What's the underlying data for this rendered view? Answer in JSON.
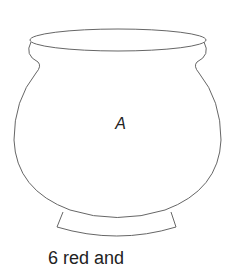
{
  "diagram": {
    "jar": {
      "label": "A",
      "stroke_color": "#666666"
    },
    "caption": "6 red and"
  }
}
